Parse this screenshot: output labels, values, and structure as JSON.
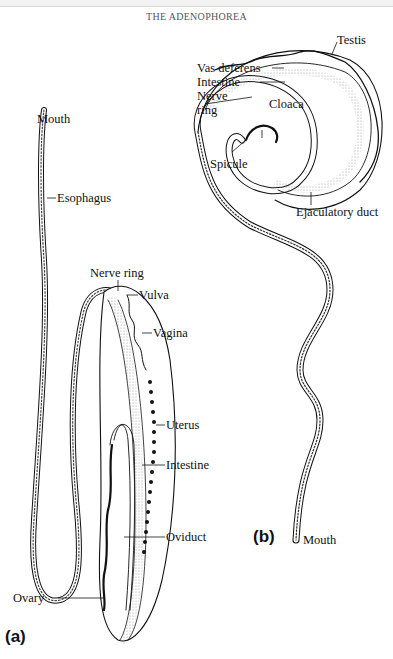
{
  "header": {
    "title": "THE ADENOPHOREA"
  },
  "figure_a": {
    "panel_label": "(a)",
    "labels": {
      "mouth": "Mouth",
      "esophagus": "Esophagus",
      "nerve_ring": "Nerve ring",
      "vulva": "Vulva",
      "vagina": "Vagina",
      "uterus": "Uterus",
      "intestine": "Intestine",
      "oviduct": "Oviduct",
      "ovary": "Ovary"
    }
  },
  "figure_b": {
    "panel_label": "(b)",
    "labels": {
      "testis": "Testis",
      "vas_deferens": "Vas deferens",
      "intestine": "Intestine",
      "nerve_ring_line1": "Nerve",
      "nerve_ring_line2": "ring",
      "cloaca": "Cloaca",
      "spicule": "Spicule",
      "ejaculatory_duct": "Ejaculatory duct",
      "mouth": "Mouth"
    }
  },
  "colors": {
    "ink": "#111111",
    "stipple": "#bdbdbd",
    "background": "#ffffff"
  }
}
